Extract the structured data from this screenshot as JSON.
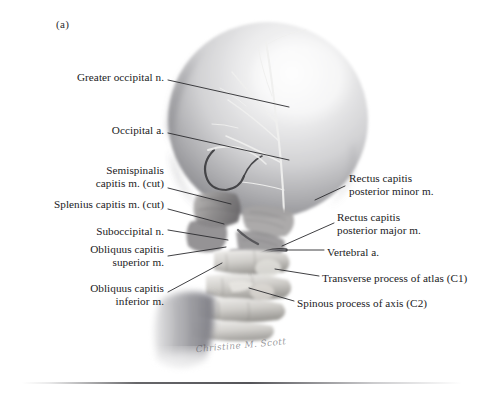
{
  "figure": {
    "marker": "(a)",
    "signature": "Christine M. Scott",
    "background_color": "#ffffff",
    "ink_color": "#1b1b1d",
    "leader_color": "#2a2a2e"
  },
  "labels_left": [
    {
      "id": "greater-occipital-nerve",
      "lines": [
        "Greater occipital n."
      ],
      "x": 36,
      "y": 71,
      "w": 128,
      "leader": [
        [
          168,
          80
        ],
        [
          289,
          107
        ]
      ]
    },
    {
      "id": "occipital-artery",
      "lines": [
        "Occipital a."
      ],
      "x": 66,
      "y": 124,
      "w": 98,
      "leader": [
        [
          168,
          133
        ],
        [
          289,
          160
        ]
      ]
    },
    {
      "id": "semispinalis-capitis",
      "lines": [
        "Semispinalis",
        "capitis m. (cut)"
      ],
      "x": 40,
      "y": 164,
      "w": 124,
      "leader": [
        [
          168,
          188
        ],
        [
          231,
          204
        ]
      ]
    },
    {
      "id": "splenius-capitis",
      "lines": [
        "Splenius capitis m. (cut)"
      ],
      "x": 22,
      "y": 198,
      "w": 142,
      "leader": [
        [
          168,
          209
        ],
        [
          224,
          224
        ]
      ]
    },
    {
      "id": "suboccipital-nerve",
      "lines": [
        "Suboccipital n."
      ],
      "x": 55,
      "y": 225,
      "w": 109,
      "leader": [
        [
          168,
          230
        ],
        [
          228,
          240
        ]
      ]
    },
    {
      "id": "obliquus-capitis-superior",
      "lines": [
        "Obliquus capitis",
        "superior m."
      ],
      "x": 54,
      "y": 243,
      "w": 110,
      "leader": [
        [
          168,
          256
        ],
        [
          226,
          247
        ]
      ]
    },
    {
      "id": "obliquus-capitis-inferior",
      "lines": [
        "Obliquus capitis",
        "inferior m."
      ],
      "x": 54,
      "y": 282,
      "w": 110,
      "leader": [
        [
          168,
          292
        ],
        [
          222,
          263
        ]
      ]
    }
  ],
  "labels_right": [
    {
      "id": "rectus-capitis-posterior-minor",
      "lines": [
        "Rectus capitis",
        "posterior minor m."
      ],
      "x": 349,
      "y": 172,
      "w": 128,
      "leader": [
        [
          345,
          186
        ],
        [
          315,
          200
        ]
      ]
    },
    {
      "id": "rectus-capitis-posterior-major",
      "lines": [
        "Rectus capitis",
        "posterior major m."
      ],
      "x": 337,
      "y": 211,
      "w": 140,
      "leader": [
        [
          334,
          223
        ],
        [
          282,
          246
        ]
      ]
    },
    {
      "id": "vertebral-artery",
      "lines": [
        "Vertebral a."
      ],
      "x": 327,
      "y": 246,
      "w": 88,
      "leader": [
        [
          324,
          250
        ],
        [
          286,
          250
        ]
      ]
    },
    {
      "id": "transverse-process-atlas",
      "lines": [
        "Transverse process of atlas (C1)"
      ],
      "x": 322,
      "y": 272,
      "w": 160,
      "leader": [
        [
          319,
          276
        ],
        [
          275,
          269
        ]
      ]
    },
    {
      "id": "spinous-process-axis",
      "lines": [
        "Spinous process of axis (C2)"
      ],
      "x": 297,
      "y": 297,
      "w": 162,
      "leader": [
        [
          294,
          301
        ],
        [
          249,
          288
        ]
      ]
    }
  ]
}
